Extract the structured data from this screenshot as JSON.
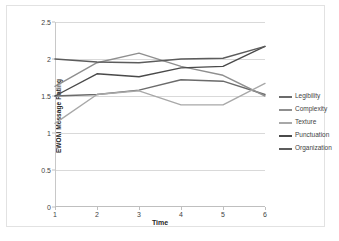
{
  "chart_data": {
    "type": "line",
    "title": "",
    "xlabel": "Time",
    "ylabel": "EWOM Message Rating",
    "x": [
      1,
      2,
      3,
      4,
      5,
      6
    ],
    "categories": [
      "1",
      "2",
      "3",
      "4",
      "5",
      "6"
    ],
    "xlim": [
      1,
      6
    ],
    "ylim": [
      0,
      2.5
    ],
    "ytick_labels": [
      "0",
      "0.5",
      "1",
      "1.5",
      "2",
      "2.5"
    ],
    "ytick_values": [
      0,
      0.5,
      1,
      1.5,
      2,
      2.5
    ],
    "grid": "horizontal",
    "legend_position": "right",
    "series": [
      {
        "name": "Legibility",
        "color": "#6b6b6b",
        "values": [
          1.5,
          1.52,
          1.58,
          1.72,
          1.7,
          1.52
        ]
      },
      {
        "name": "Complexity",
        "color": "#8f8f8f",
        "values": [
          1.63,
          1.95,
          2.08,
          1.9,
          1.78,
          1.5
        ]
      },
      {
        "name": "Texture",
        "color": "#a8a8a8",
        "values": [
          1.13,
          1.52,
          1.57,
          1.38,
          1.38,
          1.67
        ]
      },
      {
        "name": "Punctuation",
        "color": "#4a4a4a",
        "values": [
          1.5,
          1.8,
          1.76,
          1.88,
          1.9,
          2.17
        ]
      },
      {
        "name": "Organization",
        "color": "#5c5c5c",
        "values": [
          2.0,
          1.96,
          1.95,
          2.0,
          2.01,
          2.17
        ]
      }
    ]
  }
}
